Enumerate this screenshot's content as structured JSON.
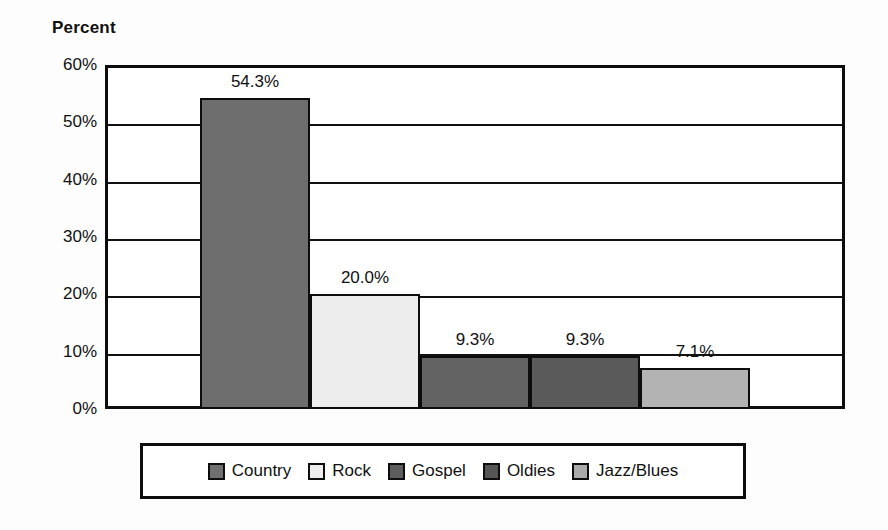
{
  "chart_data": {
    "type": "bar",
    "title": "",
    "ylabel": "Percent",
    "xlabel": "",
    "categories": [
      "Country",
      "Rock",
      "Gospel",
      "Oldies",
      "Jazz/Blues"
    ],
    "values": [
      54.3,
      20.0,
      9.3,
      9.3,
      7.1
    ],
    "data_labels": [
      "54.3%",
      "20.0%",
      "9.3%",
      "9.3%",
      "7.1%"
    ],
    "ylim": [
      0,
      60
    ],
    "ytick_labels": [
      "0%",
      "10%",
      "20%",
      "30%",
      "40%",
      "50%",
      "60%"
    ],
    "ytick_values": [
      0,
      10,
      20,
      30,
      40,
      50,
      60
    ],
    "minor_tick_values": [
      5,
      15,
      25,
      35,
      45,
      55
    ],
    "grid": true,
    "legend_position": "bottom",
    "series_colors": [
      "#6e6e6e",
      "#ededed",
      "#636363",
      "#5a5a5a",
      "#b3b3b3"
    ],
    "legend_swatch_colors": [
      "#707070",
      "#ededed",
      "#5d5d5d",
      "#555555",
      "#aaaaaa"
    ]
  },
  "axis": {
    "title": "Percent"
  },
  "legend": {
    "entries": [
      {
        "label": "Country"
      },
      {
        "label": "Rock"
      },
      {
        "label": "Gospel"
      },
      {
        "label": "Oldies"
      },
      {
        "label": "Jazz/Blues"
      }
    ]
  }
}
